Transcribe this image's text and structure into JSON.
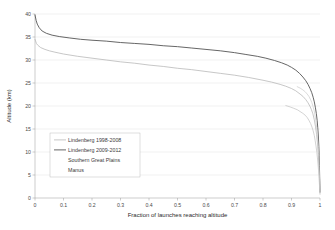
{
  "chart_data": {
    "type": "line",
    "title": "",
    "xlabel": "Fraction of launches reaching altitude",
    "ylabel": "Altitude (km)",
    "xlim": [
      0,
      1
    ],
    "ylim": [
      0,
      40
    ],
    "xticks": [
      "0",
      "0.1",
      "0.2",
      "0.3",
      "0.4",
      "0.5",
      "0.6",
      "0.7",
      "0.8",
      "0.9",
      "1"
    ],
    "xtick_values": [
      0,
      0.1,
      0.2,
      0.3,
      0.4,
      0.5,
      0.6,
      0.7,
      0.8,
      0.9,
      1
    ],
    "yticks": [
      "0",
      "5",
      "10",
      "15",
      "20",
      "25",
      "30",
      "35",
      "40"
    ],
    "ytick_values": [
      0,
      5,
      10,
      15,
      20,
      25,
      30,
      35,
      40
    ],
    "grid": "horizontal",
    "legend_position": "inside-left-center",
    "series": [
      {
        "name": "Lindenberg 1998-2008",
        "color": "#b9b9b9",
        "width": 0.8,
        "x": [
          0.0,
          0.005,
          0.01,
          0.02,
          0.035,
          0.05,
          0.07,
          0.1,
          0.15,
          0.2,
          0.25,
          0.3,
          0.35,
          0.4,
          0.45,
          0.5,
          0.55,
          0.6,
          0.65,
          0.7,
          0.75,
          0.8,
          0.83,
          0.86,
          0.88,
          0.9,
          0.915,
          0.93,
          0.94,
          0.95,
          0.958,
          0.965,
          0.97,
          0.975,
          0.98,
          0.984,
          0.988,
          0.991,
          0.994,
          0.996,
          0.998,
          0.999,
          1.0
        ],
        "y": [
          34.5,
          33.6,
          33.2,
          32.7,
          32.3,
          32.0,
          31.7,
          31.3,
          30.8,
          30.4,
          30.0,
          29.6,
          29.3,
          28.9,
          28.6,
          28.2,
          27.9,
          27.5,
          27.1,
          26.7,
          26.2,
          25.6,
          25.2,
          24.7,
          24.3,
          23.8,
          23.3,
          22.6,
          22.1,
          21.4,
          20.7,
          19.9,
          19.2,
          18.3,
          17.0,
          15.6,
          13.8,
          12.0,
          9.5,
          7.5,
          5.0,
          3.2,
          1.2
        ]
      },
      {
        "name": "Lindenberg 2009-2012",
        "color": "#555555",
        "width": 0.9,
        "x": [
          0.0,
          0.004,
          0.008,
          0.015,
          0.025,
          0.04,
          0.06,
          0.085,
          0.12,
          0.16,
          0.2,
          0.25,
          0.3,
          0.35,
          0.4,
          0.45,
          0.5,
          0.55,
          0.6,
          0.65,
          0.7,
          0.74,
          0.78,
          0.81,
          0.84,
          0.865,
          0.885,
          0.9,
          0.915,
          0.928,
          0.94,
          0.95,
          0.958,
          0.965,
          0.971,
          0.976,
          0.98,
          0.984,
          0.987,
          0.99,
          0.992,
          0.994,
          0.996,
          0.997,
          0.998,
          0.999,
          1.0
        ],
        "y": [
          39.8,
          38.6,
          37.8,
          37.0,
          36.3,
          35.8,
          35.4,
          35.1,
          34.8,
          34.5,
          34.3,
          34.1,
          33.8,
          33.6,
          33.4,
          33.1,
          32.9,
          32.6,
          32.3,
          32.0,
          31.6,
          31.2,
          30.8,
          30.4,
          29.9,
          29.4,
          28.9,
          28.4,
          27.8,
          27.1,
          26.3,
          25.5,
          24.7,
          23.8,
          22.9,
          21.9,
          20.9,
          19.6,
          18.4,
          16.9,
          15.4,
          13.7,
          11.2,
          9.3,
          7.0,
          4.2,
          1.3
        ]
      },
      {
        "name": "Southern Great Plains",
        "color": "#d2d2d2",
        "width": 0.8,
        "x": [
          0.92,
          0.93,
          0.94,
          0.948,
          0.955,
          0.961,
          0.966,
          0.971,
          0.975,
          0.979,
          0.982,
          0.985,
          0.988,
          0.99,
          0.992,
          0.994,
          0.995,
          0.996,
          0.997,
          0.998,
          0.999,
          1.0
        ],
        "y": [
          24.2,
          23.9,
          23.5,
          23.1,
          22.6,
          22.1,
          21.5,
          20.8,
          20.0,
          19.1,
          18.1,
          16.9,
          15.4,
          14.2,
          12.7,
          10.9,
          9.7,
          8.4,
          6.9,
          5.2,
          3.2,
          1.1
        ]
      },
      {
        "name": "Manus",
        "color": "#c8c8c8",
        "width": 0.8,
        "x": [
          0.88,
          0.895,
          0.908,
          0.92,
          0.93,
          0.94,
          0.948,
          0.955,
          0.961,
          0.967,
          0.972,
          0.976,
          0.98,
          0.983,
          0.986,
          0.989,
          0.991,
          0.993,
          0.995,
          0.996,
          0.998,
          0.999,
          1.0
        ],
        "y": [
          20.1,
          19.8,
          19.5,
          19.2,
          18.8,
          18.4,
          18.0,
          17.5,
          16.9,
          16.2,
          15.4,
          14.6,
          13.6,
          12.5,
          11.3,
          9.9,
          8.7,
          7.4,
          5.9,
          4.8,
          3.0,
          1.8,
          0.8
        ]
      }
    ]
  },
  "legend": {
    "entries": [
      {
        "label": "Lindenberg 1998-2008"
      },
      {
        "label": "Lindenberg 2009-2012"
      },
      {
        "label": "Southern Great Plains"
      },
      {
        "label": "Manus"
      }
    ]
  }
}
